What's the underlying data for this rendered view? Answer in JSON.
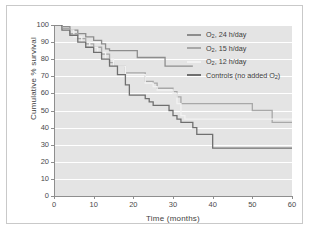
{
  "chart_data": {
    "type": "line",
    "title": "",
    "xlabel": "Time (months)",
    "ylabel": "Cumulative % survival",
    "xlim": [
      0,
      60
    ],
    "ylim": [
      0,
      100
    ],
    "xticks": [
      0,
      10,
      20,
      30,
      40,
      50,
      60
    ],
    "yticks": [
      0,
      10,
      20,
      30,
      40,
      50,
      60,
      70,
      80,
      90,
      100
    ],
    "grid": "horizontal",
    "legend_position": "top-right",
    "step_style": "post",
    "series": [
      {
        "name": "O2, 24 h/day",
        "label_main": "O",
        "label_sub": "2",
        "label_rest": ", 24 h/day",
        "color": "#8d8d8d",
        "points": [
          [
            0,
            100
          ],
          [
            2,
            99
          ],
          [
            4,
            97
          ],
          [
            6,
            95
          ],
          [
            8,
            93
          ],
          [
            10,
            91
          ],
          [
            12,
            89
          ],
          [
            13,
            86
          ],
          [
            14,
            85
          ],
          [
            20,
            85
          ],
          [
            21,
            81
          ],
          [
            27,
            81
          ],
          [
            28,
            76
          ],
          [
            35,
            76
          ]
        ]
      },
      {
        "name": "O2, 15 h/day",
        "label_main": "O",
        "label_sub": "2",
        "label_rest": ", 15 h/day",
        "color": "#a8a8a8",
        "points": [
          [
            0,
            100
          ],
          [
            2,
            98
          ],
          [
            4,
            95
          ],
          [
            6,
            92
          ],
          [
            8,
            89
          ],
          [
            10,
            87
          ],
          [
            12,
            83
          ],
          [
            14,
            78
          ],
          [
            15,
            76
          ],
          [
            17,
            76
          ],
          [
            18,
            72
          ],
          [
            22,
            72
          ],
          [
            23,
            67
          ],
          [
            25,
            66
          ],
          [
            26,
            63
          ],
          [
            29,
            63
          ],
          [
            30,
            61
          ],
          [
            31,
            58
          ],
          [
            32,
            54
          ],
          [
            49,
            54
          ],
          [
            50,
            50
          ],
          [
            54,
            50
          ],
          [
            55,
            43
          ],
          [
            61,
            43
          ]
        ]
      },
      {
        "name": "O2, 12 h/day",
        "label_main": "O",
        "label_sub": "2",
        "label_rest": ", 12 h/day",
        "color": "#f2f2f2",
        "points": [
          [
            0,
            100
          ],
          [
            2,
            97
          ],
          [
            5,
            93
          ],
          [
            7,
            90
          ],
          [
            9,
            87
          ],
          [
            11,
            84
          ],
          [
            13,
            80
          ],
          [
            15,
            76
          ],
          [
            17,
            76
          ],
          [
            18,
            71
          ],
          [
            22,
            71
          ],
          [
            23,
            66
          ],
          [
            25,
            64
          ],
          [
            26,
            62
          ],
          [
            29,
            62
          ],
          [
            30,
            60
          ],
          [
            31,
            54
          ],
          [
            32,
            47
          ],
          [
            33,
            45
          ],
          [
            61,
            45
          ]
        ]
      },
      {
        "name": "Controls (no added O2)",
        "label_main": "Controls (no added O",
        "label_sub": "2",
        "label_rest": ")",
        "color": "#6f6f6f",
        "points": [
          [
            0,
            100
          ],
          [
            2,
            97
          ],
          [
            4,
            94
          ],
          [
            6,
            90
          ],
          [
            8,
            87
          ],
          [
            10,
            84
          ],
          [
            12,
            80
          ],
          [
            14,
            76
          ],
          [
            16,
            71
          ],
          [
            18,
            65
          ],
          [
            19,
            59
          ],
          [
            22,
            59
          ],
          [
            23,
            57
          ],
          [
            24,
            55
          ],
          [
            25,
            53
          ],
          [
            28,
            53
          ],
          [
            29,
            50
          ],
          [
            30,
            47
          ],
          [
            31,
            45
          ],
          [
            32,
            43
          ],
          [
            34,
            43
          ],
          [
            35,
            40
          ],
          [
            36,
            36
          ],
          [
            39,
            36
          ],
          [
            40,
            28
          ],
          [
            61,
            28
          ]
        ]
      }
    ]
  },
  "axes": {
    "x_label": "Time (months)",
    "y_label": "Cumulative % survival",
    "x_ticks": [
      "0",
      "10",
      "20",
      "30",
      "40",
      "50",
      "60"
    ],
    "y_ticks": [
      "0",
      "10",
      "20",
      "30",
      "40",
      "50",
      "60",
      "70",
      "80",
      "90",
      "100"
    ]
  },
  "legend": {
    "items": [
      {
        "text": "O2, 24 h/day",
        "color": "#8d8d8d"
      },
      {
        "text": "O2, 15 h/day",
        "color": "#a8a8a8"
      },
      {
        "text": "O2, 12 h/day",
        "color": "#f2f2f2"
      },
      {
        "text": "Controls (no added O2)",
        "color": "#6f6f6f"
      }
    ]
  },
  "colors": {
    "plot_background": "#e4e4e4",
    "gridline": "#ffffff",
    "frame_border": "#c9c9c9",
    "axis": "#8e8e8e",
    "text": "#3f3f3f"
  }
}
